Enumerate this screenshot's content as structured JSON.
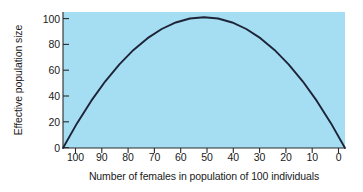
{
  "chart_data": {
    "type": "line",
    "title": "",
    "xlabel": "Number of females in population of 100 individuals",
    "ylabel": "Effective population size",
    "xlim": [
      100,
      0
    ],
    "ylim": [
      0,
      104
    ],
    "x_axis_reversed": true,
    "grid": false,
    "legend": null,
    "plot_background_color": "#a5ddf2",
    "line_color": "#1d2438",
    "xticks": [
      100,
      90,
      80,
      70,
      60,
      50,
      40,
      30,
      20,
      10,
      0
    ],
    "xtick_labels": [
      "100",
      "90",
      "80",
      "70",
      "60",
      "50",
      "40",
      "30",
      "20",
      "10",
      "0"
    ],
    "yticks": [
      0,
      20,
      40,
      60,
      80,
      100
    ],
    "ytick_labels": [
      "0",
      "20",
      "40",
      "60",
      "80",
      "100"
    ],
    "x": [
      100,
      95,
      90,
      85,
      80,
      75,
      70,
      65,
      60,
      55,
      50,
      45,
      40,
      35,
      30,
      25,
      20,
      15,
      10,
      5,
      0
    ],
    "values": [
      0,
      19,
      36,
      51,
      64,
      75,
      84,
      91,
      96,
      99,
      100,
      99,
      96,
      91,
      84,
      75,
      64,
      51,
      36,
      19,
      0
    ],
    "series": [
      {
        "name": "Effective population size",
        "values": [
          0,
          19,
          36,
          51,
          64,
          75,
          84,
          91,
          96,
          99,
          100,
          99,
          96,
          91,
          84,
          75,
          64,
          51,
          36,
          19,
          0
        ]
      }
    ],
    "annotations": [],
    "peak": {
      "x": 50,
      "y": 100
    }
  },
  "axes": {
    "y_label_text": "Effective population size",
    "x_label_text": "Number of females in population of 100 individuals"
  }
}
